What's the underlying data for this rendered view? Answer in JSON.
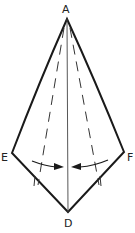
{
  "diagram": {
    "labels": {
      "A": "A",
      "D": "D",
      "E": "E",
      "F": "F"
    },
    "points": {
      "A": [
        67,
        19
      ],
      "E": [
        12,
        153
      ],
      "F": [
        124,
        152
      ],
      "D": [
        68,
        212
      ]
    },
    "elements": [
      "solid outline A-E-D-F-A",
      "center crease line A-D",
      "dashed fold line left",
      "dashed fold line right",
      "curved arrow left toward center",
      "curved arrow right toward center"
    ],
    "colors": {
      "stroke": "#1a1a1a",
      "background": "#ffffff"
    }
  }
}
